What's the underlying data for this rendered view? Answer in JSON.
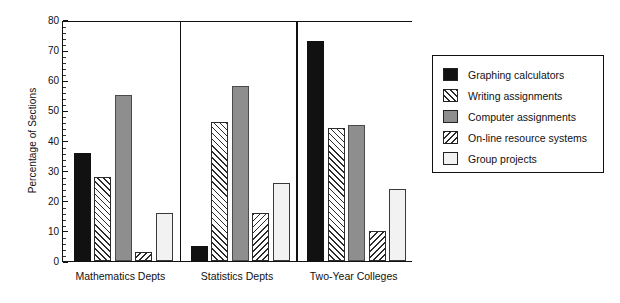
{
  "chart_data": {
    "type": "bar",
    "title": "",
    "subtitle": "",
    "xlabel": "",
    "ylabel": "Percentage of Sections",
    "ylim": [
      0,
      80
    ],
    "ytick_step": 10,
    "yticks": [
      "0",
      "10",
      "20",
      "30",
      "40",
      "50",
      "60",
      "70",
      "80"
    ],
    "grid": false,
    "legend_position": "right",
    "categories": [
      "Mathematics Depts",
      "Statistics Depts",
      "Two-Year Colleges"
    ],
    "series": [
      {
        "name": "Graphing calculators",
        "pattern": "solid-black",
        "values": [
          36,
          5,
          73
        ]
      },
      {
        "name": "Writing assignments",
        "pattern": "hatch-forward",
        "values": [
          28,
          46,
          44
        ]
      },
      {
        "name": "Computer assignments",
        "pattern": "solid-gray",
        "values": [
          55,
          58,
          45
        ]
      },
      {
        "name": "On-line resource systems",
        "pattern": "hatch-backward",
        "values": [
          3,
          16,
          10
        ]
      },
      {
        "name": "Group projects",
        "pattern": "solid-white",
        "values": [
          16,
          26,
          24
        ]
      }
    ]
  },
  "axis": {
    "y_title": "Percentage of Sections"
  },
  "legend": {
    "items": [
      {
        "label": "Graphing calculators"
      },
      {
        "label": "Writing assignments"
      },
      {
        "label": "Computer assignments"
      },
      {
        "label": "On-line resource systems"
      },
      {
        "label": "Group projects"
      }
    ]
  },
  "colors": {
    "black": "#111111",
    "gray": "#8e8e8e",
    "white": "#f2f2f2",
    "axis": "#111111"
  }
}
